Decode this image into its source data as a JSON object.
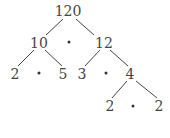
{
  "nodes": [
    {
      "id": "n120",
      "label": "120",
      "x": 68,
      "y": 11
    },
    {
      "id": "n10",
      "label": "10",
      "x": 39,
      "y": 43
    },
    {
      "id": "n12",
      "label": "12",
      "x": 104,
      "y": 43
    },
    {
      "id": "n2a",
      "label": "2",
      "x": 15,
      "y": 74
    },
    {
      "id": "n5",
      "label": "5",
      "x": 63,
      "y": 74
    },
    {
      "id": "n3",
      "label": "3",
      "x": 82,
      "y": 74
    },
    {
      "id": "n4",
      "label": "4",
      "x": 130,
      "y": 74
    },
    {
      "id": "n2b",
      "label": "2",
      "x": 110,
      "y": 106
    },
    {
      "id": "n2c",
      "label": "2",
      "x": 159,
      "y": 106
    }
  ],
  "multiply_dots": [
    {
      "x": 69,
      "y": 42
    },
    {
      "x": 39,
      "y": 73
    },
    {
      "x": 106,
      "y": 73
    },
    {
      "x": 133,
      "y": 106
    }
  ],
  "edges": [
    {
      "x1": 63,
      "y1": 19,
      "x2": 46,
      "y2": 35
    },
    {
      "x1": 76,
      "y1": 19,
      "x2": 94,
      "y2": 35
    },
    {
      "x1": 34,
      "y1": 50,
      "x2": 18,
      "y2": 66
    },
    {
      "x1": 45,
      "y1": 50,
      "x2": 62,
      "y2": 66
    },
    {
      "x1": 100,
      "y1": 50,
      "x2": 85,
      "y2": 66
    },
    {
      "x1": 110,
      "y1": 50,
      "x2": 128,
      "y2": 66
    },
    {
      "x1": 127,
      "y1": 81,
      "x2": 112,
      "y2": 98
    },
    {
      "x1": 136,
      "y1": 81,
      "x2": 157,
      "y2": 98
    }
  ],
  "colors": {
    "line": "#444444",
    "text": "#444444"
  }
}
